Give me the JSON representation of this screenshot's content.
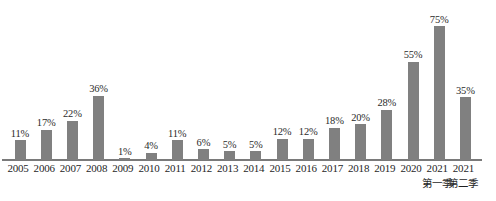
{
  "chart_data": {
    "type": "bar",
    "title": "",
    "subtitle": "",
    "xlabel": "",
    "ylabel": "",
    "ylim": [
      0,
      80
    ],
    "grid": false,
    "legend": "none",
    "axis_line_color": "#7a7a7a",
    "bar_color": "#808080",
    "label_color": "#2b2b2b",
    "value_suffix": "%",
    "categories": [
      "2005",
      "2006",
      "2007",
      "2008",
      "2009",
      "2010",
      "2011",
      "2012",
      "2013",
      "2014",
      "2015",
      "2016",
      "2017",
      "2018",
      "2019",
      "2020",
      "2021",
      "2021"
    ],
    "category_sublabels": [
      "",
      "",
      "",
      "",
      "",
      "",
      "",
      "",
      "",
      "",
      "",
      "",
      "",
      "",
      "",
      "",
      "第一季",
      "第二季"
    ],
    "values": [
      11,
      17,
      22,
      36,
      1,
      4,
      11,
      6,
      5,
      5,
      12,
      12,
      18,
      20,
      28,
      55,
      75,
      35
    ],
    "value_labels": [
      "11%",
      "17%",
      "22%",
      "36%",
      "1%",
      "4%",
      "11%",
      "6%",
      "5%",
      "5%",
      "12%",
      "12%",
      "18%",
      "20%",
      "28%",
      "55%",
      "75%",
      "35%"
    ]
  },
  "bars": [
    {
      "category": "2005",
      "sublabel": "",
      "value_label": "11%"
    },
    {
      "category": "2006",
      "sublabel": "",
      "value_label": "17%"
    },
    {
      "category": "2007",
      "sublabel": "",
      "value_label": "22%"
    },
    {
      "category": "2008",
      "sublabel": "",
      "value_label": "36%"
    },
    {
      "category": "2009",
      "sublabel": "",
      "value_label": "1%"
    },
    {
      "category": "2010",
      "sublabel": "",
      "value_label": "4%"
    },
    {
      "category": "2011",
      "sublabel": "",
      "value_label": "11%"
    },
    {
      "category": "2012",
      "sublabel": "",
      "value_label": "6%"
    },
    {
      "category": "2013",
      "sublabel": "",
      "value_label": "5%"
    },
    {
      "category": "2014",
      "sublabel": "",
      "value_label": "5%"
    },
    {
      "category": "2015",
      "sublabel": "",
      "value_label": "12%"
    },
    {
      "category": "2016",
      "sublabel": "",
      "value_label": "12%"
    },
    {
      "category": "2017",
      "sublabel": "",
      "value_label": "18%"
    },
    {
      "category": "2018",
      "sublabel": "",
      "value_label": "20%"
    },
    {
      "category": "2019",
      "sublabel": "",
      "value_label": "28%"
    },
    {
      "category": "2020",
      "sublabel": "",
      "value_label": "55%"
    },
    {
      "category": "2021",
      "sublabel": "第一季",
      "value_label": "75%"
    },
    {
      "category": "2021",
      "sublabel": "第二季",
      "value_label": "35%"
    }
  ]
}
